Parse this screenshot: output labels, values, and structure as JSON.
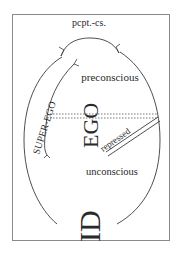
{
  "diagram": {
    "type": "freud-structural-model",
    "labels": {
      "perception_consciousness": "pcpt.-cs.",
      "preconscious": "preconscious",
      "unconscious": "unconscious",
      "superego": "SUPER-EGO",
      "ego": "EGO",
      "id": "ID",
      "repressed": "repressed"
    },
    "colors": {
      "line": "#3a3a3a",
      "frame": "#8a8a8a",
      "text": "#2a2a2a",
      "background": "#ffffff"
    }
  }
}
